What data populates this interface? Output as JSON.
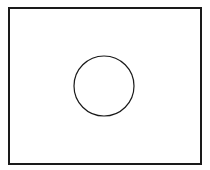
{
  "diagram": {
    "background": "#ffffff",
    "stroke_color": "#1a1a1a",
    "rectangle": {
      "x": 9,
      "y": 8,
      "width": 192,
      "height": 156,
      "stroke_width": 2
    },
    "circle": {
      "cx": 104,
      "cy": 86,
      "r": 30,
      "stroke_width": 1.2
    }
  }
}
